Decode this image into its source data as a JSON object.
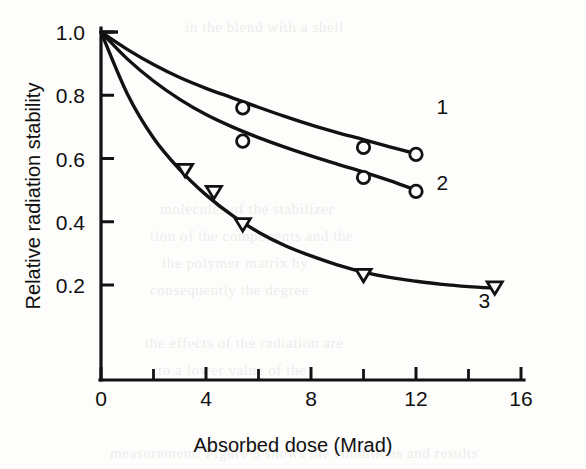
{
  "figure": {
    "kind": "scanned-line-chart",
    "ink_color": "#121212",
    "paper_color": "#fdfdfb"
  },
  "chart_data": {
    "type": "line",
    "title": "",
    "xlabel": "Absorbed dose (Mrad)",
    "ylabel": "Relative radiation stability",
    "xlim": [
      0,
      16
    ],
    "ylim": [
      0.1,
      1.04
    ],
    "xticks": [
      0,
      4,
      8,
      12,
      16
    ],
    "xtick_labels": [
      "0",
      "4",
      "8",
      "12",
      "16"
    ],
    "x_minor_ticks": [
      2,
      6,
      10,
      14
    ],
    "yticks": [
      0.2,
      0.4,
      0.6,
      0.8,
      1.0
    ],
    "ytick_labels": [
      "0.2",
      "0.4",
      "0.6",
      "0.8",
      "1.0"
    ],
    "grid": false,
    "legend_position": "inline-curve-end-labels",
    "series": [
      {
        "name": "1",
        "label": "1",
        "marker": "open-circle",
        "label_position": {
          "x": 13.0,
          "y": 0.74
        },
        "points": [
          {
            "x": 5.4,
            "y": 0.76
          },
          {
            "x": 10.0,
            "y": 0.635
          },
          {
            "x": 12.0,
            "y": 0.613
          }
        ],
        "curve": [
          {
            "x": 0.0,
            "y": 1.0
          },
          {
            "x": 1.0,
            "y": 0.945
          },
          {
            "x": 2.0,
            "y": 0.897
          },
          {
            "x": 3.0,
            "y": 0.856
          },
          {
            "x": 4.0,
            "y": 0.822
          },
          {
            "x": 5.0,
            "y": 0.792
          },
          {
            "x": 6.0,
            "y": 0.762
          },
          {
            "x": 7.0,
            "y": 0.733
          },
          {
            "x": 8.0,
            "y": 0.706
          },
          {
            "x": 9.0,
            "y": 0.682
          },
          {
            "x": 10.0,
            "y": 0.66
          },
          {
            "x": 11.0,
            "y": 0.637
          },
          {
            "x": 12.0,
            "y": 0.615
          }
        ]
      },
      {
        "name": "2",
        "label": "2",
        "marker": "open-circle",
        "label_position": {
          "x": 13.0,
          "y": 0.5
        },
        "points": [
          {
            "x": 5.4,
            "y": 0.655
          },
          {
            "x": 10.0,
            "y": 0.54
          },
          {
            "x": 12.0,
            "y": 0.496
          }
        ],
        "curve": [
          {
            "x": 0.0,
            "y": 1.0
          },
          {
            "x": 1.0,
            "y": 0.915
          },
          {
            "x": 2.0,
            "y": 0.845
          },
          {
            "x": 3.0,
            "y": 0.787
          },
          {
            "x": 4.0,
            "y": 0.739
          },
          {
            "x": 5.0,
            "y": 0.7
          },
          {
            "x": 6.0,
            "y": 0.666
          },
          {
            "x": 7.0,
            "y": 0.636
          },
          {
            "x": 8.0,
            "y": 0.608
          },
          {
            "x": 9.0,
            "y": 0.582
          },
          {
            "x": 10.0,
            "y": 0.557
          },
          {
            "x": 11.0,
            "y": 0.53
          },
          {
            "x": 12.0,
            "y": 0.5
          }
        ]
      },
      {
        "name": "3",
        "label": "3",
        "marker": "open-triangle-down",
        "label_position": {
          "x": 14.6,
          "y": 0.128
        },
        "points": [
          {
            "x": 3.2,
            "y": 0.562
          },
          {
            "x": 4.3,
            "y": 0.492
          },
          {
            "x": 5.4,
            "y": 0.39
          },
          {
            "x": 10.0,
            "y": 0.23
          },
          {
            "x": 15.0,
            "y": 0.19
          }
        ],
        "curve": [
          {
            "x": 0.0,
            "y": 1.0
          },
          {
            "x": 1.0,
            "y": 0.805
          },
          {
            "x": 2.0,
            "y": 0.665
          },
          {
            "x": 3.0,
            "y": 0.565
          },
          {
            "x": 4.0,
            "y": 0.485
          },
          {
            "x": 5.0,
            "y": 0.42
          },
          {
            "x": 6.0,
            "y": 0.367
          },
          {
            "x": 7.0,
            "y": 0.325
          },
          {
            "x": 8.0,
            "y": 0.292
          },
          {
            "x": 9.0,
            "y": 0.264
          },
          {
            "x": 10.0,
            "y": 0.241
          },
          {
            "x": 11.0,
            "y": 0.224
          },
          {
            "x": 12.0,
            "y": 0.212
          },
          {
            "x": 13.0,
            "y": 0.202
          },
          {
            "x": 14.0,
            "y": 0.195
          },
          {
            "x": 15.0,
            "y": 0.19
          }
        ]
      }
    ]
  },
  "bleed_through": {
    "lines": [
      {
        "text": "in the blend with a shell",
        "x": 185,
        "y": 14
      },
      {
        "text": "molecules of the stabilizer",
        "x": 160,
        "y": 196
      },
      {
        "text": "tion of the components and the",
        "x": 150,
        "y": 223
      },
      {
        "text": "the polymer matrix by",
        "x": 162,
        "y": 250
      },
      {
        "text": "consequently the degree",
        "x": 150,
        "y": 277
      },
      {
        "text": "the effects of the radiation are",
        "x": 145,
        "y": 330
      },
      {
        "text": "to a lower value of the",
        "x": 158,
        "y": 357
      },
      {
        "text": "measurement. Figure 5 shows the conditions and results",
        "x": 110,
        "y": 440
      }
    ]
  }
}
